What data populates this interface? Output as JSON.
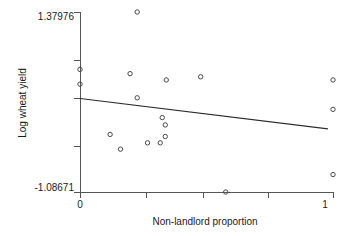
{
  "chart_data": {
    "type": "scatter",
    "title": "",
    "xlabel": "Non-landlord proportion",
    "ylabel": "Log wheat yield",
    "xlim": [
      0,
      1
    ],
    "ylim": [
      -1.08671,
      1.37976
    ],
    "grid": false,
    "legend": null,
    "x_ticks": [
      {
        "value": 0,
        "label": "0",
        "labeled": true
      },
      {
        "value": 0.259,
        "label": "",
        "labeled": false
      },
      {
        "value": 0.486,
        "label": "",
        "labeled": false
      },
      {
        "value": 0.745,
        "label": "",
        "labeled": false
      },
      {
        "value": 1,
        "label": "1",
        "labeled": true
      }
    ],
    "y_ticks": [
      {
        "value": 1.37976,
        "label": "1.37976",
        "labeled": true
      },
      {
        "value": 0.72063,
        "label": "",
        "labeled": false
      },
      {
        "value": 0.20149,
        "label": "",
        "labeled": false
      },
      {
        "value": -0.45764,
        "label": "",
        "labeled": false
      },
      {
        "value": -1.08671,
        "label": "-1.08671",
        "labeled": false
      }
    ],
    "y_tick_bottom_label": "-1.08671",
    "marker": {
      "shape": "open-circle",
      "radius_px": 2.2,
      "color": "#4a4a4a"
    },
    "points": [
      {
        "x": 0.0,
        "y": 0.593
      },
      {
        "x": 0.0,
        "y": 0.391
      },
      {
        "x": 0.119,
        "y": -0.298
      },
      {
        "x": 0.16,
        "y": -0.5
      },
      {
        "x": 0.198,
        "y": 0.535
      },
      {
        "x": 0.226,
        "y": 0.204
      },
      {
        "x": 0.226,
        "y": 1.38
      },
      {
        "x": 0.267,
        "y": -0.413
      },
      {
        "x": 0.317,
        "y": -0.413
      },
      {
        "x": 0.341,
        "y": 0.449
      },
      {
        "x": 0.325,
        "y": -0.067
      },
      {
        "x": 0.337,
        "y": -0.168
      },
      {
        "x": 0.337,
        "y": -0.326
      },
      {
        "x": 0.477,
        "y": 0.492
      },
      {
        "x": 0.576,
        "y": -1.087
      },
      {
        "x": 1.0,
        "y": 0.449
      },
      {
        "x": 1.0,
        "y": 0.046
      },
      {
        "x": 1.0,
        "y": -0.848
      }
    ],
    "fit_line": {
      "type": "linear",
      "x0": 0.0,
      "y0": 0.195,
      "x1": 0.98,
      "y1": -0.222,
      "intercept": 0.195,
      "slope": -0.425
    }
  },
  "plot_geometry": {
    "left_px": 80,
    "right_px": 333,
    "top_px": 12,
    "bottom_px": 192,
    "x_axis_y_px": 192,
    "y_axis_x_px": 80
  }
}
